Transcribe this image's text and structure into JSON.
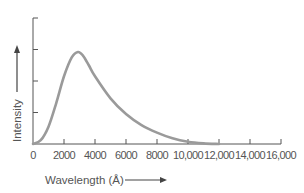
{
  "chart_data": {
    "type": "line",
    "title": "",
    "xlabel": "Wavelength (Å)",
    "ylabel": "Intensity",
    "xlim": [
      0,
      16000
    ],
    "ylim": [
      0,
      4
    ],
    "x_ticks": [
      0,
      2000,
      4000,
      6000,
      8000,
      10000,
      12000,
      14000,
      16000
    ],
    "x_tick_labels": [
      "0",
      "2000",
      "4000",
      "6000",
      "8000",
      "10,000",
      "12,000",
      "14,000",
      "16,000"
    ],
    "y_ticks": [
      0,
      1,
      2,
      3,
      4
    ],
    "y_tick_labels": [
      "",
      "",
      "",
      "",
      ""
    ],
    "grid": false,
    "legend": null,
    "axis_arrows": {
      "x": "right-pointing arrow after x-axis title",
      "y": "upward arrow above y-axis title"
    },
    "series": [
      {
        "name": "Intensity spectrum",
        "color": "#9a9a9a",
        "x": [
          0,
          500,
          1000,
          1500,
          2000,
          2500,
          2900,
          3200,
          3600,
          4000,
          5000,
          6000,
          7000,
          8000,
          9000,
          10000,
          11000,
          12000
        ],
        "values": [
          0,
          0.12,
          0.55,
          1.3,
          2.15,
          2.75,
          2.92,
          2.82,
          2.5,
          2.15,
          1.45,
          0.95,
          0.6,
          0.36,
          0.18,
          0.07,
          0.02,
          0
        ]
      }
    ],
    "annotations": []
  },
  "labels": {
    "x_axis_title": "Wavelength (Å)",
    "y_axis_title": "Intensity"
  },
  "colors": {
    "curve": "#9a9a9a",
    "axis": "#555555",
    "text": "#555555"
  }
}
